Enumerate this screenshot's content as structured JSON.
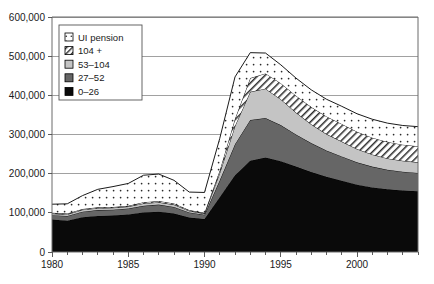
{
  "chart_data": {
    "type": "area",
    "stacked": true,
    "title": "",
    "subtitle": "",
    "xlabel": "",
    "ylabel": "",
    "xlim": [
      1980,
      2004
    ],
    "ylim": [
      0,
      600000
    ],
    "ytick_values": [
      0,
      100000,
      200000,
      300000,
      400000,
      500000,
      600000
    ],
    "ytick_labels": [
      "0",
      "100,000",
      "200,000",
      "300,000",
      "400,000",
      "500,000",
      "600,000"
    ],
    "xtick_values": [
      1980,
      1985,
      1990,
      1995,
      2000
    ],
    "xtick_labels": [
      "1980",
      "1985",
      "1990",
      "1995",
      "2000"
    ],
    "minor_xticks_every": 1,
    "grid": "horizontal",
    "legend_position": "upper-left-inside",
    "x": [
      1980,
      1981,
      1982,
      1983,
      1984,
      1985,
      1986,
      1987,
      1988,
      1989,
      1990,
      1991,
      1992,
      1993,
      1994,
      1995,
      1996,
      1997,
      1998,
      1999,
      2000,
      2001,
      2002,
      2003,
      2004
    ],
    "series": [
      {
        "name": "0–26",
        "fill": "black",
        "values": [
          83000,
          80000,
          89000,
          92000,
          93000,
          96000,
          101000,
          103000,
          98000,
          88000,
          84000,
          140000,
          196000,
          233000,
          241000,
          232000,
          218000,
          204000,
          192000,
          182000,
          172000,
          165000,
          160000,
          157000,
          155000
        ]
      },
      {
        "name": "27–52",
        "fill": "dark-gray",
        "values": [
          11000,
          12000,
          14000,
          15000,
          15000,
          15000,
          17000,
          18000,
          17000,
          13000,
          11000,
          43000,
          79000,
          104000,
          101000,
          92000,
          82000,
          74000,
          67000,
          62000,
          57000,
          53000,
          50000,
          48000,
          47000
        ]
      },
      {
        "name": "53–104",
        "fill": "light-gray",
        "values": [
          4000,
          4000,
          5000,
          5000,
          5000,
          5000,
          6000,
          6000,
          6000,
          4000,
          3000,
          19000,
          47000,
          72000,
          75000,
          66000,
          56000,
          48000,
          42000,
          38000,
          34000,
          31000,
          29000,
          28000,
          27000
        ]
      },
      {
        "name": "104 +",
        "fill": "diagonal-hatch",
        "values": [
          2000,
          2000,
          2000,
          2000,
          2000,
          2000,
          3000,
          3000,
          3000,
          2000,
          2000,
          6000,
          18000,
          35000,
          39000,
          41000,
          43000,
          44000,
          45000,
          45000,
          44000,
          43000,
          42000,
          41000,
          41000
        ]
      },
      {
        "name": "UI pension",
        "fill": "dotted",
        "values": [
          22000,
          25000,
          34000,
          46000,
          52000,
          57000,
          69000,
          69000,
          59000,
          46000,
          52000,
          82000,
          107000,
          65000,
          52000,
          47000,
          45000,
          44000,
          44000,
          45000,
          46000,
          47000,
          48000,
          49000,
          50000
        ]
      }
    ],
    "stack_order_bottom_to_top": [
      "0–26",
      "27–52",
      "53–104",
      "104 +",
      "UI pension"
    ],
    "totals": [
      122000,
      123000,
      144000,
      160000,
      167000,
      175000,
      196000,
      199000,
      183000,
      153000,
      152000,
      290000,
      447000,
      509000,
      508000,
      478000,
      444000,
      414000,
      390000,
      372000,
      353000,
      339000,
      329000,
      323000,
      320000
    ]
  },
  "legend": {
    "entries": [
      {
        "label": "UI pension",
        "swatch": "dotted"
      },
      {
        "label": "104 +",
        "swatch": "diagonal-hatch"
      },
      {
        "label": "53–104",
        "swatch": "light-gray"
      },
      {
        "label": "27–52",
        "swatch": "dark-gray"
      },
      {
        "label": "0–26",
        "swatch": "black"
      }
    ]
  },
  "colors": {
    "black": "#0a0a0a",
    "dark_gray": "#666666",
    "light_gray": "#c4c4c4",
    "hatch_bg": "#ffffff",
    "dotted_bg": "#ffffff",
    "outline": "#000000",
    "gridline": "#8a8a8a",
    "axis": "#6b6b6b",
    "text": "#1a1a1a",
    "plot_background": "#ffffff"
  },
  "axes": {
    "y_labels": [
      "600,000",
      "500,000",
      "400,000",
      "300,000",
      "200,000",
      "100,000",
      "0"
    ],
    "x_labels": [
      "1980",
      "1985",
      "1990",
      "1995",
      "2000"
    ]
  }
}
